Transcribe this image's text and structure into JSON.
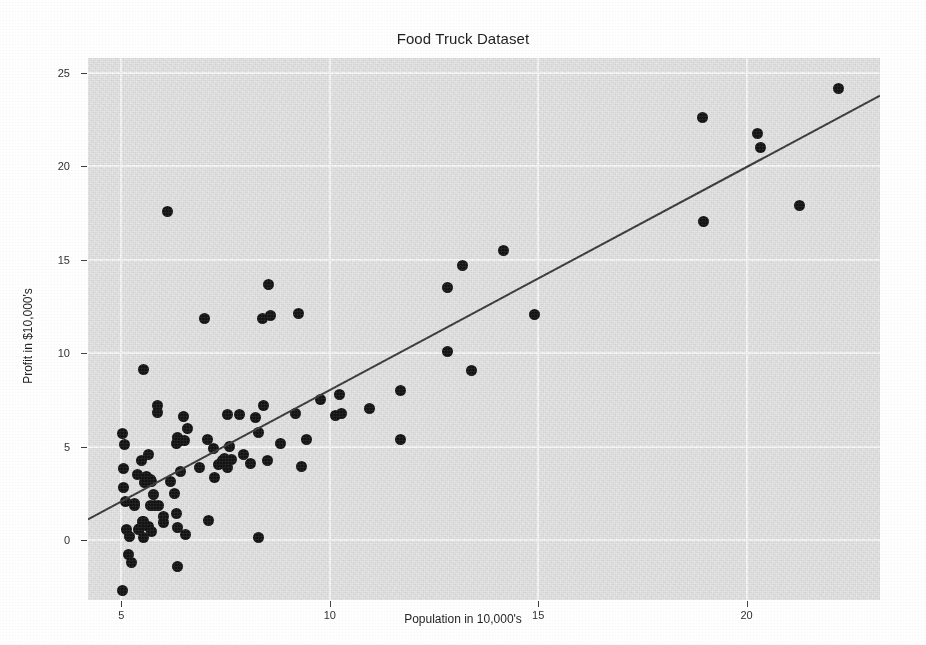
{
  "chart_data": {
    "type": "scatter",
    "title": "Food Truck Dataset",
    "xlabel": "Population in 10,000's",
    "ylabel": "Profit in $10,000's",
    "xlim": [
      4.2,
      23.2
    ],
    "ylim": [
      -3.2,
      25.8
    ],
    "xticks": [
      5,
      10,
      15,
      20
    ],
    "xtick_labels": [
      "5",
      "10",
      "15",
      "20"
    ],
    "yticks": [
      0,
      5,
      10,
      15,
      20,
      25
    ],
    "ytick_labels": [
      "0",
      "5",
      "10",
      "15",
      "20",
      "25"
    ],
    "grid": true,
    "grid_color": "#fdfdfd",
    "panel_color": "#e9e9e9",
    "legend": "none",
    "marker_color": "#141414",
    "marker_size": 11,
    "series": [
      {
        "name": "Training data",
        "type": "scatter",
        "x": [
          6.1101,
          5.5277,
          8.5186,
          7.0032,
          5.8598,
          8.3829,
          7.4764,
          8.5781,
          6.4862,
          5.0546,
          5.7107,
          14.164,
          5.734,
          8.4084,
          5.6407,
          5.3794,
          6.3654,
          5.1301,
          6.4296,
          7.0708,
          6.1891,
          20.27,
          5.4901,
          6.3261,
          5.5649,
          18.945,
          12.828,
          10.957,
          13.176,
          22.203,
          5.2524,
          6.5894,
          9.2482,
          5.8918,
          8.2111,
          7.9334,
          8.0959,
          5.6063,
          12.836,
          6.3534,
          5.4069,
          6.8825,
          11.708,
          5.7737,
          7.8247,
          7.0931,
          5.0702,
          5.8014,
          11.7,
          5.5416,
          7.5402,
          5.3077,
          7.4239,
          7.6031,
          6.3328,
          6.3589,
          6.2742,
          5.6397,
          9.3102,
          9.4536,
          8.8254,
          5.1793,
          21.279,
          14.908,
          18.959,
          7.2182,
          8.2951,
          10.236,
          5.4994,
          20.341,
          10.136,
          7.3345,
          6.0062,
          7.2259,
          5.0269,
          6.5479,
          7.5386,
          5.0365,
          10.274,
          5.1077,
          5.7292,
          5.1884,
          6.3557,
          9.7687,
          6.5159,
          8.5172,
          9.1802,
          6.002,
          5.5204,
          5.0594,
          5.7077,
          7.6366,
          5.8707,
          5.3054,
          8.2934,
          13.394,
          5.4369
        ],
        "y": [
          17.592,
          9.1302,
          13.662,
          11.854,
          6.8233,
          11.886,
          4.3483,
          12.0,
          6.5987,
          3.8166,
          3.2522,
          15.505,
          3.1551,
          7.2258,
          0.71618,
          3.5129,
          5.3048,
          0.56077,
          3.6518,
          5.3893,
          3.1386,
          21.767,
          4.263,
          5.1875,
          3.0825,
          22.638,
          13.501,
          7.0467,
          14.692,
          24.147,
          -1.22,
          5.9966,
          12.134,
          1.8495,
          6.5426,
          4.5623,
          4.1164,
          3.3928,
          10.117,
          5.4974,
          0.55657,
          3.9115,
          5.3854,
          2.4406,
          6.7318,
          1.0463,
          5.1337,
          1.844,
          8.0043,
          1.0179,
          6.7504,
          1.8396,
          4.2885,
          4.9981,
          1.4233,
          -1.4211,
          2.4756,
          4.6042,
          3.9624,
          5.4141,
          5.1694,
          -0.74279,
          17.929,
          12.054,
          17.054,
          4.8852,
          5.7442,
          7.7754,
          1.0173,
          20.992,
          6.6799,
          4.0259,
          1.2784,
          3.3411,
          -2.6807,
          0.29678,
          3.8845,
          5.7014,
          6.7526,
          2.0576,
          0.47953,
          0.20421,
          0.67861,
          7.5435,
          5.3436,
          4.2415,
          6.7981,
          0.92695,
          0.152,
          2.8214,
          1.8451,
          4.2959,
          7.2029,
          1.9869,
          0.14454,
          9.0551,
          0.61705
        ]
      },
      {
        "name": "Linear regression fit",
        "type": "line",
        "color": "#3b3b3b",
        "width": 2,
        "slope": 1.1931,
        "intercept": -3.8958,
        "endpoints": [
          [
            4.2,
            1.116
          ],
          [
            23.2,
            23.783
          ]
        ]
      }
    ]
  }
}
